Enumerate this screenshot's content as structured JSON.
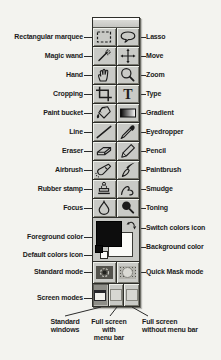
{
  "figure_title": "Photoshop toolbox diagram",
  "palette": {
    "rows": [
      {
        "left": "Rectangular marquee",
        "right": "Lasso"
      },
      {
        "left": "Magic wand",
        "right": "Move"
      },
      {
        "left": "Hand",
        "right": "Zoom"
      },
      {
        "left": "Cropping",
        "right": "Type"
      },
      {
        "left": "Paint bucket",
        "right": "Gradient"
      },
      {
        "left": "Line",
        "right": "Eyedropper"
      },
      {
        "left": "Eraser",
        "right": "Pencil"
      },
      {
        "left": "Airbrush",
        "right": "Paintbrush"
      },
      {
        "left": "Rubber stamp",
        "right": "Smudge"
      },
      {
        "left": "Focus",
        "right": "Toning"
      }
    ],
    "type_glyph": "T",
    "color_section": {
      "foreground_label": "Foreground color",
      "background_label": "Background color",
      "switch_label": "Switch colors icon",
      "default_label": "Default colors icon",
      "foreground_color": "#0d0d0d",
      "background_color": "#fbfbf8"
    },
    "mode_row": {
      "left_label": "Standard mode",
      "right_label": "Quick Mask mode"
    },
    "screen_row_label": "Screen modes",
    "screen_buttons": [
      {
        "lines": [
          "Standard",
          "windows"
        ]
      },
      {
        "lines": [
          "Full screen",
          "with",
          "menu bar"
        ]
      },
      {
        "lines": [
          "Full screen",
          "without menu bar"
        ]
      }
    ]
  },
  "icons": {
    "tool_icons": [
      "rectangular-marquee-icon",
      "lasso-icon",
      "magic-wand-icon",
      "move-icon",
      "hand-icon",
      "zoom-icon",
      "cropping-icon",
      "type-icon",
      "paint-bucket-icon",
      "gradient-icon",
      "line-icon",
      "eyedropper-icon",
      "eraser-icon",
      "pencil-icon",
      "airbrush-icon",
      "paintbrush-icon",
      "rubber-stamp-icon",
      "smudge-icon",
      "focus-icon",
      "toning-icon"
    ],
    "other_icons": [
      "switch-colors-icon",
      "default-colors-icon",
      "standard-mode-icon",
      "quick-mask-icon",
      "standard-windows-icon",
      "full-screen-menubar-icon",
      "full-screen-no-menubar-icon"
    ]
  },
  "colors": {
    "page_background": "#f3f3ef",
    "palette_background": "#c8c9c5",
    "line_color": "#2b2b2b",
    "text_color": "#1b1b1b"
  }
}
